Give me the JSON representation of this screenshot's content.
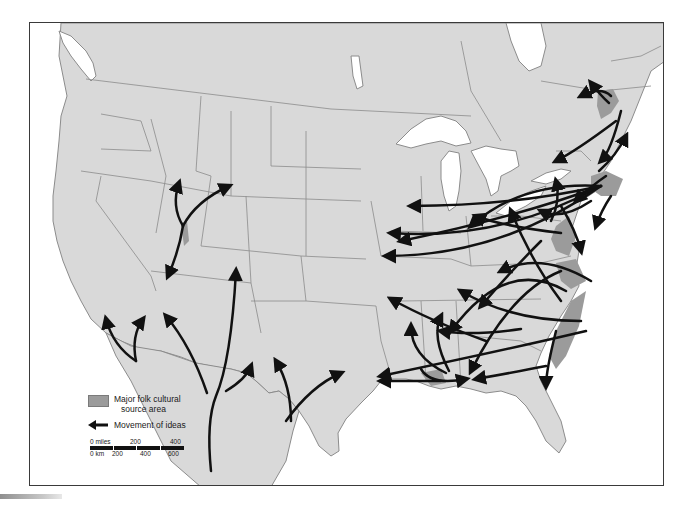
{
  "map": {
    "title": "",
    "region": "United States (contiguous) with southern Canada and northern Mexico",
    "colors": {
      "ocean": "#ffffff",
      "land": "#d9d9d9",
      "borders": "#8c8c8c",
      "source_area": "#9b9b9b",
      "arrows": "#111111",
      "frame": "#3a3a3a"
    }
  },
  "legend": {
    "source_area_label_line1": "Major folk cultural",
    "source_area_label_line2": "source area",
    "movement_label": "Movement of ideas"
  },
  "scale": {
    "miles_label": "0 miles",
    "miles_ticks": [
      "200",
      "400"
    ],
    "km_label": "0 km",
    "km_ticks": [
      "200",
      "400",
      "600"
    ]
  }
}
